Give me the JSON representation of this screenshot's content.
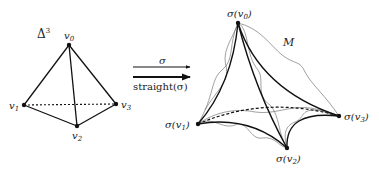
{
  "left_simplex": {
    "label": "Δ",
    "label_sup": "3",
    "vertices": [
      {
        "id": "v0",
        "label": "v",
        "sub": "0"
      },
      {
        "id": "v1",
        "label": "v",
        "sub": "1"
      },
      {
        "id": "v2",
        "label": "v",
        "sub": "2"
      },
      {
        "id": "v3",
        "label": "v",
        "sub": "3"
      }
    ]
  },
  "arrows": {
    "top_label": "σ",
    "bottom_label": "straight(σ)"
  },
  "right_simplex": {
    "manifold_label": "M",
    "vertices": [
      {
        "id": "sv0",
        "label": "σ(v",
        "sub": "0",
        "close": ")"
      },
      {
        "id": "sv1",
        "label": "σ(v",
        "sub": "1",
        "close": ")"
      },
      {
        "id": "sv2",
        "label": "σ(v",
        "sub": "2",
        "close": ")"
      },
      {
        "id": "sv3",
        "label": "σ(v",
        "sub": "3",
        "close": ")"
      }
    ]
  }
}
